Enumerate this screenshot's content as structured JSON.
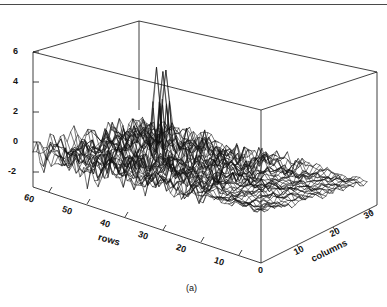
{
  "figure": {
    "caption": "(a)",
    "background_color": "#ffffff",
    "line_color": "#101010",
    "rule_color": "#4a4a4a"
  },
  "chart_data": {
    "type": "line",
    "subtype": "3d-mesh-waterfall",
    "title": "",
    "subtitle": "",
    "caption": "(a)",
    "xlabel": "rows",
    "ylabel": "columns",
    "zlabel": "",
    "grid": false,
    "legend": "none",
    "projection": {
      "azimuth_note": "rows axis recedes to upper-left, columns axis recedes to upper-right",
      "origin_label": "0"
    },
    "axes": {
      "rows": {
        "label": "rows",
        "ticks": [
          60,
          50,
          40,
          30,
          20,
          10
        ],
        "tick_labels": [
          "60",
          "50",
          "40",
          "30",
          "20",
          "10"
        ],
        "range": [
          64,
          0
        ],
        "direction": "descending left-to-right"
      },
      "columns": {
        "label": "columns",
        "ticks": [
          0,
          10,
          20,
          30
        ],
        "tick_labels": [
          "0",
          "10",
          "20",
          "30"
        ],
        "range": [
          0,
          32
        ],
        "direction": "ascending left-to-right"
      },
      "z": {
        "label": "",
        "ticks": [
          -2,
          0,
          2,
          4,
          6
        ],
        "tick_labels": [
          "-2",
          "0",
          "2",
          "4",
          "6"
        ],
        "range": [
          -3,
          6
        ]
      }
    },
    "surface": {
      "n_rows": 64,
      "n_columns": 32,
      "description": "Noisy residual surface: low amplitude at high row indices (left/back), amplitude grows toward low row indices (right/front); several sharp spikes reach z above 4 near the mid-right of the mesh.",
      "z_min_approx": -3.0,
      "z_max_approx": 5.2,
      "amplitude_profile_by_row": [
        {
          "row": 60,
          "rms": 0.35,
          "peak": 1.0
        },
        {
          "row": 55,
          "rms": 0.45,
          "peak": 1.3
        },
        {
          "row": 50,
          "rms": 0.6,
          "peak": 1.7
        },
        {
          "row": 45,
          "rms": 0.8,
          "peak": 2.2
        },
        {
          "row": 40,
          "rms": 1.05,
          "peak": 2.9
        },
        {
          "row": 35,
          "rms": 1.25,
          "peak": 3.2
        },
        {
          "row": 30,
          "rms": 1.45,
          "peak": 3.6
        },
        {
          "row": 25,
          "rms": 1.55,
          "peak": 4.0
        },
        {
          "row": 20,
          "rms": 1.65,
          "peak": 4.6
        },
        {
          "row": 15,
          "rms": 1.7,
          "peak": 5.2
        },
        {
          "row": 10,
          "rms": 1.6,
          "peak": 4.2
        },
        {
          "row": 5,
          "rms": 1.5,
          "peak": 3.4
        },
        {
          "row": 0,
          "rms": 1.4,
          "peak": 3.0
        }
      ],
      "notable_spikes": [
        {
          "row": 18,
          "column": 17,
          "z": 5.2
        },
        {
          "row": 16,
          "column": 21,
          "z": 4.6
        },
        {
          "row": 14,
          "column": 24,
          "z": 4.4
        }
      ]
    }
  },
  "ticks": {
    "z": [
      {
        "label": "6"
      },
      {
        "label": "4"
      },
      {
        "label": "2"
      },
      {
        "label": "0"
      },
      {
        "label": "-2"
      }
    ],
    "rows": [
      {
        "label": "60"
      },
      {
        "label": "50"
      },
      {
        "label": "40"
      },
      {
        "label": "30"
      },
      {
        "label": "20"
      },
      {
        "label": "10"
      }
    ],
    "columns": [
      {
        "label": "0"
      },
      {
        "label": "10"
      },
      {
        "label": "20"
      },
      {
        "label": "30"
      }
    ]
  },
  "labels": {
    "rows_axis_title": "rows",
    "columns_axis_title": "columns"
  }
}
